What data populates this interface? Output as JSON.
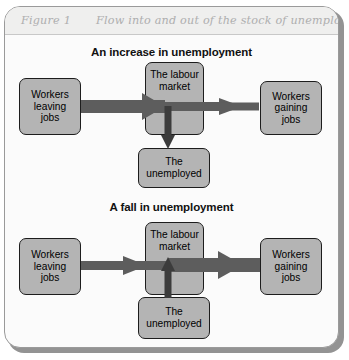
{
  "figure": {
    "label": "Figure 1",
    "title": "Flow into and out of the stock of unemployed workers"
  },
  "sections": [
    {
      "id": "increase",
      "heading": "An increase in unemployment",
      "nodes": {
        "left": "Workers\nleaving\njobs",
        "left_line1": "Workers",
        "left_line2": "leaving",
        "left_line3": "jobs",
        "center_line1": "The labour",
        "center_line2": "market",
        "right_line1": "Workers",
        "right_line2": "gaining",
        "right_line3": "jobs",
        "bottom_line1": "The",
        "bottom_line2": "unemployed"
      },
      "flows": {
        "inflow_weight": "thick",
        "outflow_weight": "thin",
        "vertical_direction": "down"
      }
    },
    {
      "id": "fall",
      "heading": "A fall in unemployment",
      "nodes": {
        "left_line1": "Workers",
        "left_line2": "leaving",
        "left_line3": "jobs",
        "center_line1": "The labour",
        "center_line2": "market",
        "right_line1": "Workers",
        "right_line2": "gaining",
        "right_line3": "jobs",
        "bottom_line1": "The",
        "bottom_line2": "unemployed"
      },
      "flows": {
        "inflow_weight": "thin",
        "outflow_weight": "thick",
        "vertical_direction": "up"
      }
    }
  ],
  "colors": {
    "arrow": "#5d5d5d",
    "box_fill": "#b4b4b4",
    "box_border": "#1d1d1d",
    "frame_border": "#9a9a9a",
    "title_text": "#aeaeae",
    "banner_bg": "#efefee",
    "page_bg": "#fbfbfb"
  }
}
